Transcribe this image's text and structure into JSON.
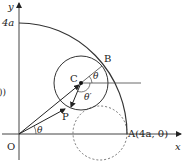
{
  "diagram": {
    "axis_x_label": "x",
    "axis_y_label": "y",
    "origin_label": "O",
    "y_tick_label": "4a",
    "point_A_label": "A(4a, 0)",
    "point_B_label": "B",
    "point_C_label": "C",
    "point_P_label": "P",
    "angle_theta_label": "θ",
    "angle_theta_B_label": "θ",
    "angle_theta_prime_label": "θ′",
    "left_edge_fragment": "))"
  }
}
